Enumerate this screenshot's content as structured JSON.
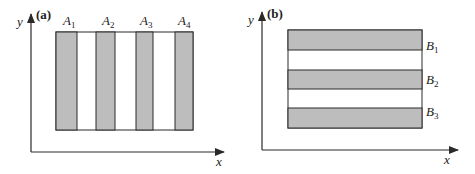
{
  "panels": [
    {
      "id": "a",
      "label": "(a)",
      "axes": {
        "x": "x",
        "y": "y"
      },
      "orientation": "vertical",
      "stripes": [
        {
          "name": "A",
          "sub": "1"
        },
        {
          "name": "A",
          "sub": "2"
        },
        {
          "name": "A",
          "sub": "3"
        },
        {
          "name": "A",
          "sub": "4"
        }
      ]
    },
    {
      "id": "b",
      "label": "(b)",
      "axes": {
        "x": "x",
        "y": "y"
      },
      "orientation": "horizontal",
      "stripes": [
        {
          "name": "B",
          "sub": "1"
        },
        {
          "name": "B",
          "sub": "2"
        },
        {
          "name": "B",
          "sub": "3"
        }
      ]
    }
  ],
  "colors": {
    "stripe_fill": "#bdbdbd",
    "line": "#2a2a2a",
    "background": "#ffffff"
  }
}
